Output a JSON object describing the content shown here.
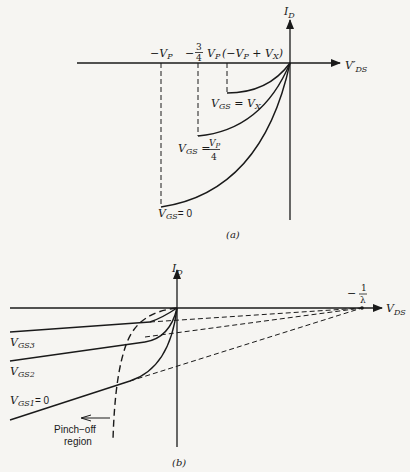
{
  "figure_a": {
    "caption": "(a)",
    "y_axis_label": "I",
    "y_axis_sub": "D",
    "x_axis_label": "V′",
    "x_axis_sub": "DS",
    "tick_neg_vp": "−V",
    "tick_neg_vp_sub": "P",
    "tick_34_prefix": "−",
    "tick_34_num": "3",
    "tick_34_den": "4",
    "tick_34_v": "V",
    "tick_34_sub": "P",
    "tick_vpvx": "(−V",
    "tick_vpvx_sub1": "P",
    "tick_vpvx_mid": " + V",
    "tick_vpvx_sub2": "X",
    "tick_vpvx_end": ")",
    "curves": [
      {
        "label_v": "V",
        "label_sub": "GS",
        "label_eq": " = V",
        "label_eq_sub": "X"
      },
      {
        "label_v": "V",
        "label_sub": "GS",
        "label_eq": " = ",
        "frac_num": "V",
        "frac_num_sub": "P",
        "frac_den": "4"
      },
      {
        "label_v": "V",
        "label_sub": "GS",
        "label_eq": "= 0"
      }
    ]
  },
  "figure_b": {
    "caption": "(b)",
    "y_axis_label": "I",
    "y_axis_sub": "D",
    "x_axis_label": "V",
    "x_axis_sub": "DS",
    "intercept_num": "1",
    "intercept_den": "λ",
    "intercept_sign": "−",
    "curves": [
      {
        "label_v": "V",
        "label_sub": "GS3",
        "label_eq": ""
      },
      {
        "label_v": "V",
        "label_sub": "GS2",
        "label_eq": ""
      },
      {
        "label_v": "V",
        "label_sub": "GS1",
        "label_eq": "= 0"
      }
    ],
    "pinch_off_line1": "Pinch−off",
    "pinch_off_line2": "region"
  }
}
